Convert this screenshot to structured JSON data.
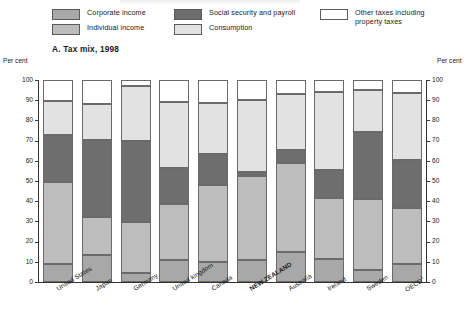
{
  "legend": {
    "columns": [
      {
        "items": [
          {
            "label": "Corporate income",
            "key": "corporate",
            "color": "#a8a8a8"
          },
          {
            "label": "Individual income",
            "key": "individual",
            "color": "#bdbdbd"
          }
        ]
      },
      {
        "items": [
          {
            "label": "Social security and payroll",
            "key": "social_security",
            "color": "#6e6e6e"
          },
          {
            "label": "Consumption",
            "key": "consumption",
            "color": "#e2e2e2"
          }
        ]
      },
      {
        "items": [
          {
            "label": "Other taxes including property taxes",
            "key": "other",
            "color": "#ffffff"
          }
        ]
      }
    ]
  },
  "panel": {
    "title": "A.  Tax mix, 1998",
    "unit_left": "Per cent",
    "unit_right": "Per cent"
  },
  "chart_data": {
    "type": "bar",
    "stacked": true,
    "title": "A.  Tax mix, 1998",
    "xlabel": "",
    "ylabel": "Per cent",
    "ylim": [
      0,
      100
    ],
    "yticks": [
      0,
      10,
      20,
      30,
      40,
      50,
      60,
      70,
      80,
      90,
      100
    ],
    "grid": false,
    "legend_position": "top",
    "categories": [
      "United States",
      "Japan",
      "Germany",
      "United kingdom",
      "Canada",
      "NEW ZEALAND",
      "Australia",
      "Ireland",
      "Sweden",
      "OECD"
    ],
    "category_labels": [
      "United States",
      "Japan",
      "Germany",
      "United kingdom",
      "Canada",
      "NEW ZEALAND",
      "Australia",
      "Ireland",
      "Sweden",
      "OECD¹"
    ],
    "highlight_category": "NEW ZEALAND",
    "series": [
      {
        "name": "Corporate income",
        "color": "#a8a8a8",
        "values": [
          9.0,
          13.5,
          4.5,
          11.0,
          10.0,
          11.0,
          15.0,
          11.5,
          6.0,
          9.0
        ]
      },
      {
        "name": "Individual income",
        "color": "#bdbdbd",
        "values": [
          40.5,
          18.5,
          25.0,
          27.5,
          38.0,
          41.5,
          44.0,
          30.0,
          35.0,
          27.5
        ]
      },
      {
        "name": "Social security and payroll",
        "color": "#6e6e6e",
        "values": [
          23.5,
          38.5,
          40.5,
          18.0,
          15.5,
          2.0,
          6.5,
          14.0,
          33.5,
          24.0
        ]
      },
      {
        "name": "Consumption",
        "color": "#e2e2e2",
        "values": [
          16.5,
          17.5,
          27.0,
          32.5,
          25.0,
          35.5,
          27.5,
          38.5,
          20.5,
          33.0
        ]
      },
      {
        "name": "Other taxes including property taxes",
        "color": "#ffffff",
        "values": [
          10.5,
          12.0,
          3.0,
          11.0,
          11.5,
          10.0,
          7.0,
          6.0,
          5.0,
          6.5
        ]
      }
    ],
    "cumulative_tops": [
      [
        9.0,
        49.5,
        73.0,
        89.5,
        100
      ],
      [
        13.5,
        32.0,
        70.5,
        88.0,
        100
      ],
      [
        4.5,
        29.5,
        70.0,
        97.0,
        100
      ],
      [
        11.0,
        38.5,
        56.5,
        89.0,
        100
      ],
      [
        10.0,
        48.0,
        63.5,
        88.5,
        100
      ],
      [
        11.0,
        52.5,
        54.5,
        90.0,
        100
      ],
      [
        15.0,
        59.0,
        65.5,
        93.0,
        100
      ],
      [
        11.5,
        41.5,
        55.5,
        94.0,
        100
      ],
      [
        6.0,
        41.0,
        74.5,
        95.0,
        100
      ],
      [
        9.0,
        36.5,
        60.5,
        93.5,
        100
      ]
    ]
  }
}
